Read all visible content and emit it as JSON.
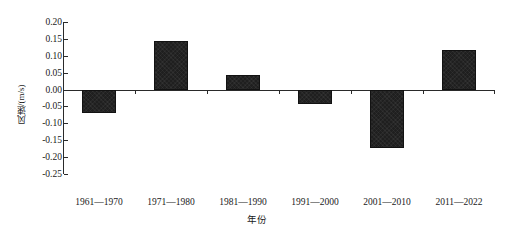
{
  "chart_data": {
    "type": "bar",
    "title": "",
    "subtitle": "",
    "xlabel": "年份",
    "ylabel": "风速/(m/s)",
    "categories": [
      "1961—1970",
      "1971—1980",
      "1981—1990",
      "1991—2000",
      "2001—2010",
      "2011—2022"
    ],
    "values": [
      -0.068,
      0.145,
      0.042,
      -0.042,
      -0.172,
      0.118
    ],
    "series": [
      {
        "name": "风速距平",
        "values": [
          -0.068,
          0.145,
          0.042,
          -0.042,
          -0.172,
          0.118
        ]
      }
    ],
    "ylim": [
      -0.25,
      0.2
    ],
    "ytick_values": [
      0.2,
      0.15,
      0.1,
      0.05,
      0.0,
      -0.05,
      -0.1,
      -0.15,
      -0.2,
      -0.25
    ],
    "ytick_labels": [
      "0.20",
      "0.15",
      "0.10",
      "0.05",
      "0.00",
      "-0.05",
      "-0.10",
      "-0.15",
      "-0.20",
      "-0.25"
    ],
    "grid": false,
    "legend": false,
    "legend_position": "none",
    "bar_color": "#1f1f1f",
    "axis_color": "#2a2a2a",
    "background_color": "#ffffff",
    "baseline_value": 0.0
  }
}
